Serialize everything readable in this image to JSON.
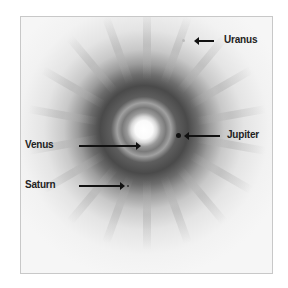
{
  "image": {
    "description": "Fisheye sky image with the bright Sun/Venus at center and labeled planets",
    "labels": {
      "uranus": "Uranus",
      "jupiter": "Jupiter",
      "venus": "Venus",
      "saturn": "Saturn"
    }
  }
}
